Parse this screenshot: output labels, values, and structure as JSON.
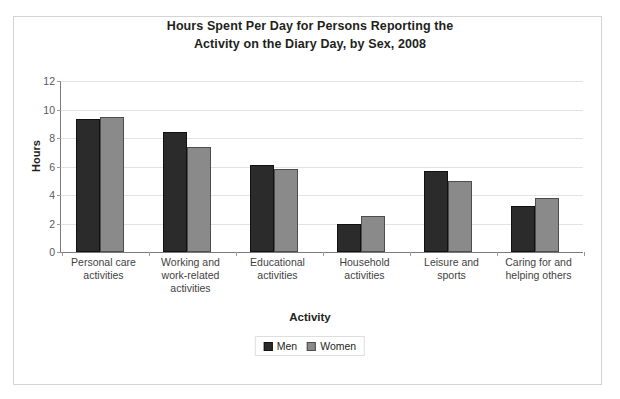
{
  "chart_data": {
    "type": "bar",
    "title": "Hours Spent Per Day for Persons Reporting the Activity on the Diary Day, by Sex, 2008",
    "title_lines": [
      "Hours Spent Per Day for Persons Reporting the",
      "Activity on the Diary Day, by Sex, 2008"
    ],
    "xlabel": "Activity",
    "ylabel": "Hours",
    "ylim": [
      0,
      12
    ],
    "ytick_step": 2,
    "yticks": [
      "12",
      "10",
      "8",
      "6",
      "4",
      "2",
      "0"
    ],
    "grid": true,
    "legend_position": "bottom-center",
    "categories": [
      "Personal care activities",
      "Working and work-related activities",
      "Educational activities",
      "Household activities",
      "Leisure and sports",
      "Caring for and helping others"
    ],
    "category_label_lines": [
      [
        "Personal care",
        "activities"
      ],
      [
        "Working and",
        "work-related",
        "activities"
      ],
      [
        "Educational",
        "activities"
      ],
      [
        "Household",
        "activities"
      ],
      [
        "Leisure and",
        "sports"
      ],
      [
        "Caring for and",
        "helping others"
      ]
    ],
    "series": [
      {
        "name": "Men",
        "color": "#2b2b2b",
        "values": [
          9.3,
          8.4,
          6.1,
          2.0,
          5.7,
          3.2
        ]
      },
      {
        "name": "Women",
        "color": "#8a8a8a",
        "values": [
          9.5,
          7.4,
          5.8,
          2.5,
          5.0,
          3.8
        ]
      }
    ]
  },
  "legend": {
    "entries": [
      {
        "label": "Men"
      },
      {
        "label": "Women"
      }
    ]
  }
}
